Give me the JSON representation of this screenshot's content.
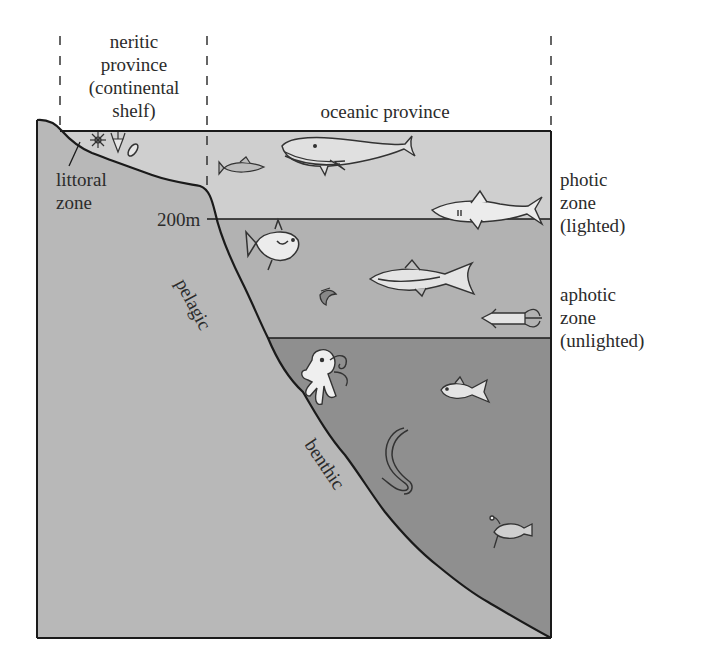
{
  "diagram": {
    "colors": {
      "land": "#b8b8b8",
      "photic": "#cfcfcf",
      "aphotic": "#b2b2b2",
      "deep": "#8f8f8f",
      "line": "#1a1a1a",
      "organism_fill": "#e6e6e6"
    },
    "provinces": {
      "neritic": [
        "neritic",
        "province",
        "(continental",
        "shelf)"
      ],
      "oceanic": "oceanic province"
    },
    "zones_right": {
      "photic": [
        "photic",
        "zone",
        "(lighted)"
      ],
      "aphotic": [
        "aphotic",
        "zone",
        "(unlighted)"
      ]
    },
    "labels": {
      "littoral": [
        "littoral",
        "zone"
      ],
      "depth_marker": "200m",
      "pelagic": "pelagic",
      "benthic": "benthic"
    },
    "organisms": [
      {
        "name": "plankton-star",
        "zone": "neritic"
      },
      {
        "name": "plankton-diatom",
        "zone": "neritic"
      },
      {
        "name": "plankton-oval",
        "zone": "neritic"
      },
      {
        "name": "small-fish",
        "zone": "photic"
      },
      {
        "name": "whale",
        "zone": "photic"
      },
      {
        "name": "shark",
        "zone": "photic"
      },
      {
        "name": "round-fish",
        "zone": "aphotic"
      },
      {
        "name": "tuna",
        "zone": "aphotic"
      },
      {
        "name": "shrimp",
        "zone": "aphotic"
      },
      {
        "name": "squid",
        "zone": "aphotic"
      },
      {
        "name": "octopus",
        "zone": "deep"
      },
      {
        "name": "deep-fish",
        "zone": "deep"
      },
      {
        "name": "eel",
        "zone": "deep"
      },
      {
        "name": "anglerfish",
        "zone": "deep"
      }
    ]
  }
}
